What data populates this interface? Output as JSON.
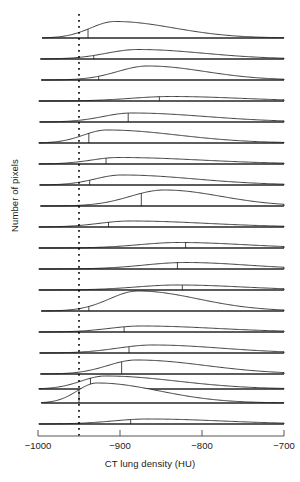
{
  "chart_data": {
    "type": "area",
    "title": "",
    "subtitle": "",
    "xlabel": "CT lung density (HU)",
    "ylabel": "Number of pixels",
    "xlim": [
      -1000,
      -700
    ],
    "ylim": [
      0,
      1
    ],
    "grid": false,
    "legend": null,
    "xticks": [
      -1000,
      -900,
      -800,
      -700
    ],
    "xticklabels": [
      "−1000",
      "−900",
      "−800",
      "−700"
    ],
    "yticks": [],
    "yticklabels": [],
    "annotations": [
      {
        "name": "emphysema-threshold",
        "type": "vline",
        "x": -950,
        "style": "dotted",
        "color": "#000000",
        "label": ""
      }
    ],
    "plot_kind": "ridgeline",
    "median_marker": "vertical tick at subject median density",
    "series": [
      {
        "name": "subject-01",
        "baseline_y": 38,
        "peak_x": -906,
        "peak_height": 16.5,
        "spread": 0.4,
        "skew": 0.62,
        "median_x": -939,
        "left_x": -995,
        "right_x": -700
      },
      {
        "name": "subject-02",
        "baseline_y": 59,
        "peak_x": -878,
        "peak_height": 9.5,
        "spread": 0.46,
        "skew": 0.52,
        "median_x": -932,
        "left_x": -997,
        "right_x": -700
      },
      {
        "name": "subject-03",
        "baseline_y": 80,
        "peak_x": -866,
        "peak_height": 14.0,
        "spread": 0.42,
        "skew": 0.5,
        "median_x": -926,
        "left_x": -996,
        "right_x": -700
      },
      {
        "name": "subject-04",
        "baseline_y": 101,
        "peak_x": -838,
        "peak_height": 4.5,
        "spread": 0.55,
        "skew": 0.4,
        "median_x": -852,
        "left_x": -999,
        "right_x": -700
      },
      {
        "name": "subject-05",
        "baseline_y": 122,
        "peak_x": -886,
        "peak_height": 9.0,
        "spread": 0.48,
        "skew": 0.48,
        "median_x": -890,
        "left_x": -998,
        "right_x": -700
      },
      {
        "name": "subject-06",
        "baseline_y": 143,
        "peak_x": -916,
        "peak_height": 13.0,
        "spread": 0.44,
        "skew": 0.58,
        "median_x": -938,
        "left_x": -999,
        "right_x": -700
      },
      {
        "name": "subject-07",
        "baseline_y": 164,
        "peak_x": -902,
        "peak_height": 6.5,
        "spread": 0.5,
        "skew": 0.5,
        "median_x": -917,
        "left_x": -999,
        "right_x": -700
      },
      {
        "name": "subject-08",
        "baseline_y": 185,
        "peak_x": -898,
        "peak_height": 10.0,
        "spread": 0.46,
        "skew": 0.52,
        "median_x": -937,
        "left_x": -998,
        "right_x": -700
      },
      {
        "name": "subject-09",
        "baseline_y": 206,
        "peak_x": -846,
        "peak_height": 16.0,
        "spread": 0.45,
        "skew": 0.45,
        "median_x": -874,
        "left_x": -997,
        "right_x": -700
      },
      {
        "name": "subject-10",
        "baseline_y": 227,
        "peak_x": -888,
        "peak_height": 6.0,
        "spread": 0.5,
        "skew": 0.5,
        "median_x": -914,
        "left_x": -999,
        "right_x": -700
      },
      {
        "name": "subject-11",
        "baseline_y": 248,
        "peak_x": -828,
        "peak_height": 5.5,
        "spread": 0.55,
        "skew": 0.38,
        "median_x": -820,
        "left_x": -999,
        "right_x": -700
      },
      {
        "name": "subject-12",
        "baseline_y": 269,
        "peak_x": -820,
        "peak_height": 6.5,
        "spread": 0.55,
        "skew": 0.38,
        "median_x": -830,
        "left_x": -999,
        "right_x": -700
      },
      {
        "name": "subject-13",
        "baseline_y": 290,
        "peak_x": -830,
        "peak_height": 5.0,
        "spread": 0.55,
        "skew": 0.4,
        "median_x": -824,
        "left_x": -999,
        "right_x": -700
      },
      {
        "name": "subject-14",
        "baseline_y": 311,
        "peak_x": -878,
        "peak_height": 20.0,
        "spread": 0.42,
        "skew": 0.52,
        "median_x": -938,
        "left_x": -996,
        "right_x": -700
      },
      {
        "name": "subject-15",
        "baseline_y": 332,
        "peak_x": -874,
        "peak_height": 6.0,
        "spread": 0.5,
        "skew": 0.46,
        "median_x": -895,
        "left_x": -999,
        "right_x": -700
      },
      {
        "name": "subject-16",
        "baseline_y": 353,
        "peak_x": -860,
        "peak_height": 8.0,
        "spread": 0.5,
        "skew": 0.46,
        "median_x": -889,
        "left_x": -998,
        "right_x": -700
      },
      {
        "name": "subject-17",
        "baseline_y": 374,
        "peak_x": -880,
        "peak_height": 14.0,
        "spread": 0.46,
        "skew": 0.48,
        "median_x": -898,
        "left_x": -997,
        "right_x": -700
      },
      {
        "name": "subject-18",
        "baseline_y": 389,
        "peak_x": -918,
        "peak_height": 13.0,
        "spread": 0.45,
        "skew": 0.6,
        "median_x": -936,
        "left_x": -999,
        "right_x": -700
      },
      {
        "name": "subject-19",
        "baseline_y": 403,
        "peak_x": -928,
        "peak_height": 20.0,
        "spread": 0.4,
        "skew": 0.66,
        "median_x": -950,
        "left_x": -996,
        "right_x": -700
      },
      {
        "name": "subject-20",
        "baseline_y": 424,
        "peak_x": -866,
        "peak_height": 5.0,
        "spread": 0.52,
        "skew": 0.46,
        "median_x": -887,
        "left_x": -999,
        "right_x": -700
      }
    ]
  },
  "axis": {
    "x_pixel_left": 38,
    "x_pixel_right": 284,
    "axis_line_y": 436,
    "tick_length": 6
  },
  "colors": {
    "line": "#1a1a1a",
    "axis": "#555555",
    "text": "#1a1a1a",
    "background": "#ffffff"
  }
}
